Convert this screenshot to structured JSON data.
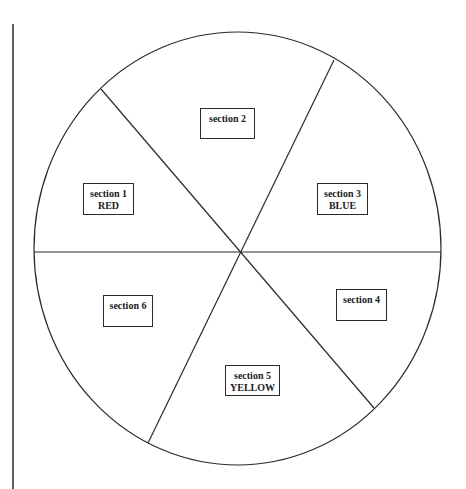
{
  "diagram": {
    "type": "sectioned-circle",
    "stroke_color": "#2a2a2a",
    "background": "#ffffff",
    "margin_line": {
      "x": 13,
      "y1": 24,
      "y2": 489
    },
    "circle": {
      "cx": 237.5,
      "cy": 248.5,
      "rx": 203.5,
      "ry": 216.5
    },
    "center_point": {
      "x": 240,
      "y": 252
    },
    "divider_endpoints": [
      {
        "name": "upper-left",
        "x": 101,
        "y": 89
      },
      {
        "name": "upper-right",
        "x": 334,
        "y": 60
      },
      {
        "name": "right",
        "x": 441,
        "y": 252
      },
      {
        "name": "lower-right",
        "x": 374,
        "y": 408
      },
      {
        "name": "lower-left",
        "x": 148,
        "y": 443
      },
      {
        "name": "left",
        "x": 34,
        "y": 252
      }
    ],
    "sections": [
      {
        "id": 1,
        "title": "section 1",
        "color_label": "RED",
        "box": {
          "x": 83,
          "y": 183,
          "w": 51,
          "h": 32
        }
      },
      {
        "id": 2,
        "title": "section 2",
        "color_label": "",
        "box": {
          "x": 200,
          "y": 108,
          "w": 55,
          "h": 31
        }
      },
      {
        "id": 3,
        "title": "section 3",
        "color_label": "BLUE",
        "box": {
          "x": 317,
          "y": 183,
          "w": 51,
          "h": 32
        }
      },
      {
        "id": 4,
        "title": "section 4",
        "color_label": "",
        "box": {
          "x": 336,
          "y": 289,
          "w": 51,
          "h": 32
        }
      },
      {
        "id": 5,
        "title": "section 5",
        "color_label": "YELLOW",
        "box": {
          "x": 225,
          "y": 365,
          "w": 55,
          "h": 31
        }
      },
      {
        "id": 6,
        "title": "section 6",
        "color_label": "",
        "box": {
          "x": 103,
          "y": 295,
          "w": 50,
          "h": 32
        }
      }
    ]
  }
}
